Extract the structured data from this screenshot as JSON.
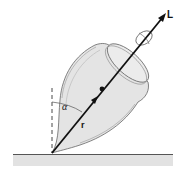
{
  "diagram": {
    "labels": {
      "angular_momentum": "L",
      "tilt_angle": "α",
      "position_vector": "r"
    },
    "colors": {
      "top_body": "#e4e4e4",
      "outline": "#555555",
      "vector": "#111111",
      "ground": "#e2e2e2"
    }
  }
}
